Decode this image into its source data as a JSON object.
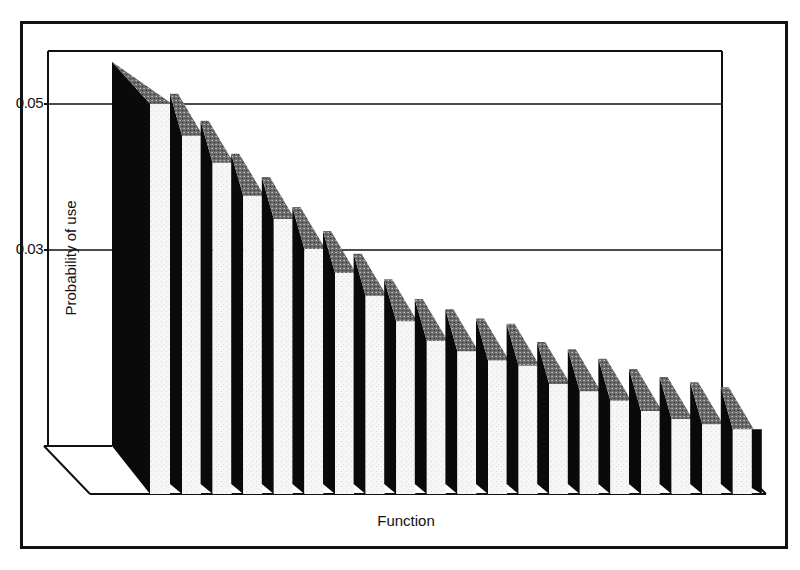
{
  "chart_data": {
    "type": "bar",
    "style": "3d-oblique",
    "title": "",
    "xlabel": "Function",
    "ylabel": "Probability of use",
    "yticks": [
      0.03,
      0.05
    ],
    "ytick_labels": [
      "0.03",
      "0.05"
    ],
    "ylim": [
      0.003,
      0.058
    ],
    "grid": true,
    "legend": null,
    "categories": [
      "1",
      "2",
      "3",
      "4",
      "5",
      "6",
      "7",
      "8",
      "9",
      "10",
      "11",
      "12",
      "13",
      "14",
      "15",
      "16",
      "17",
      "18",
      "19",
      "20"
    ],
    "values": [
      0.0558,
      0.0514,
      0.0477,
      0.0432,
      0.04,
      0.0359,
      0.0326,
      0.0295,
      0.026,
      0.0233,
      0.0219,
      0.0206,
      0.0199,
      0.0174,
      0.0164,
      0.0151,
      0.0137,
      0.0126,
      0.0119,
      0.0112
    ]
  },
  "labels": {
    "xlabel": "Function",
    "ylabel": "Probability of use",
    "tick_005": "0.05",
    "tick_003": "0.03"
  },
  "colors": {
    "front_face": "#f4f4f4",
    "side_face": "#0a0a0a",
    "top_face": "#6e6e6e",
    "line": "#111111"
  }
}
